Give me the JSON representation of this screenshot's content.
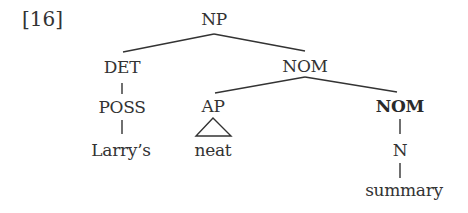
{
  "example_number": "[16]",
  "tree": {
    "root": {
      "label": "NP",
      "children": [
        {
          "label": "DET",
          "children": [
            {
              "label": "POSS",
              "children": [
                {
                  "label": "Larry's",
                  "terminal": true
                }
              ]
            }
          ]
        },
        {
          "label": "NOM",
          "children": [
            {
              "label": "AP",
              "triangle": true,
              "children": [
                {
                  "label": "neat",
                  "terminal": true
                }
              ]
            },
            {
              "label": "NOM",
              "bold": true,
              "children": [
                {
                  "label": "N",
                  "children": [
                    {
                      "label": "summary",
                      "terminal": true
                    }
                  ]
                }
              ]
            }
          ]
        }
      ]
    }
  },
  "labels": {
    "np": "NP",
    "det": "DET",
    "nom_mid": "NOM",
    "poss": "POSS",
    "ap": "AP",
    "nom_bold": "NOM",
    "n": "N",
    "larrys": "Larry’s",
    "neat": "neat",
    "summary": "summary"
  },
  "colors": {
    "text": "#333333",
    "lines": "#333333",
    "background": "#ffffff"
  }
}
